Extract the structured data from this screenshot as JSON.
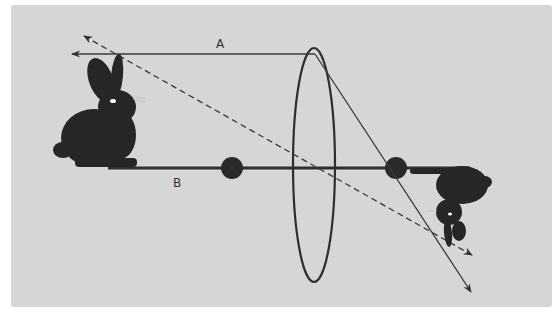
{
  "diagram": {
    "colors": {
      "background": "#d6d6d6",
      "ink": "#2a2a2a",
      "ray": "#3a3a3a"
    },
    "labels": {
      "ray_a": "A",
      "axis_b": "B"
    },
    "elements": {
      "object": "rabbit (upright)",
      "image": "rabbit (inverted)",
      "lens": "convex lens (ellipse)",
      "focal_points": [
        "F left",
        "F right"
      ],
      "rays": [
        "parallel ray A refracted through focal point",
        "dashed ray through lens center"
      ],
      "optical_axis": "B"
    }
  }
}
